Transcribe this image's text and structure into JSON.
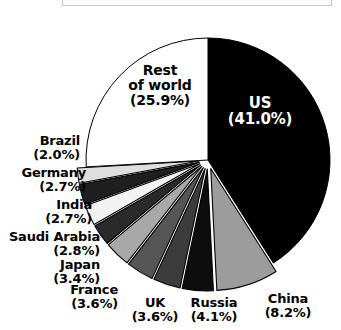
{
  "caption": {
    "text": "Share of global total"
  },
  "chart_data": {
    "type": "pie",
    "title": "",
    "units": "percent",
    "legend": "none",
    "labels_inline": true,
    "start_angle_deg": 0,
    "direction": "clockwise",
    "categories": [
      "US",
      "China",
      "Russia",
      "UK",
      "France",
      "Japan",
      "Saudi Arabia",
      "India",
      "Germany",
      "Brazil",
      "Rest of world"
    ],
    "values": [
      41.0,
      8.2,
      4.1,
      3.6,
      3.6,
      3.4,
      2.8,
      2.7,
      2.7,
      2.0,
      25.9
    ],
    "slices": [
      {
        "name": "US",
        "value": 41.0,
        "label": "US",
        "pct": "(41.0%)",
        "color": "#000000",
        "exploded": false,
        "text_color": "#ffffff"
      },
      {
        "name": "China",
        "value": 8.2,
        "label": "China",
        "pct": "(8.2%)",
        "color": "#9c9c9c",
        "exploded": true,
        "text_color": "#000000"
      },
      {
        "name": "Russia",
        "value": 4.1,
        "label": "Russia",
        "pct": "(4.1%)",
        "color": "#0d0d0d",
        "exploded": true,
        "text_color": "#000000"
      },
      {
        "name": "UK",
        "value": 3.6,
        "label": "UK",
        "pct": "(3.6%)",
        "color": "#3c3c3c",
        "exploded": true,
        "text_color": "#000000"
      },
      {
        "name": "France",
        "value": 3.6,
        "label": "France",
        "pct": "(3.6%)",
        "color": "#565656",
        "exploded": true,
        "text_color": "#000000"
      },
      {
        "name": "Japan",
        "value": 3.4,
        "label": "Japan",
        "pct": "(3.4%)",
        "color": "#a8a8a8",
        "exploded": true,
        "text_color": "#000000"
      },
      {
        "name": "Saudi Arabia",
        "value": 2.8,
        "label": "Saudi Arabia",
        "pct": "(2.8%)",
        "color": "#2a2a2a",
        "exploded": true,
        "text_color": "#000000"
      },
      {
        "name": "India",
        "value": 2.7,
        "label": "India",
        "pct": "(2.7%)",
        "color": "#f2f2f2",
        "exploded": true,
        "text_color": "#000000"
      },
      {
        "name": "Germany",
        "value": 2.7,
        "label": "Germany",
        "pct": "(2.7%)",
        "color": "#1f1f1f",
        "exploded": true,
        "text_color": "#000000"
      },
      {
        "name": "Brazil",
        "value": 2.0,
        "label": "Brazil",
        "pct": "(2.0%)",
        "color": "#dedede",
        "exploded": true,
        "text_color": "#000000"
      },
      {
        "name": "Rest of world",
        "value": 25.9,
        "label_line1": "Rest",
        "label_line2": "of world",
        "label": "Rest of world",
        "pct": "(25.9%)",
        "color": "#ffffff",
        "exploded": false,
        "text_color": "#000000"
      }
    ],
    "geometry": {
      "cx": 208,
      "cy": 160,
      "radius": 122,
      "explode_offset": 9,
      "gap_stroke": "#ffffff",
      "outline": "#000000"
    }
  }
}
